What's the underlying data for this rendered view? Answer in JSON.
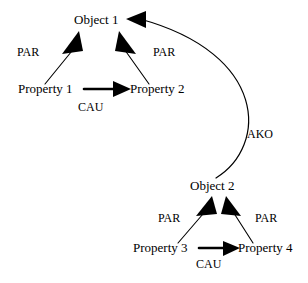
{
  "diagram": {
    "type": "node-link-diagram",
    "width": 308,
    "height": 283,
    "background_color": "#ffffff",
    "ink_color": "#000000",
    "nodes": [
      {
        "id": "object1",
        "label": "Object 1",
        "x": 74,
        "y": 24,
        "anchor": "start"
      },
      {
        "id": "property1",
        "label": "Property 1",
        "x": 18,
        "y": 93,
        "anchor": "start"
      },
      {
        "id": "property2",
        "label": "Property 2",
        "x": 130,
        "y": 93,
        "anchor": "start"
      },
      {
        "id": "object2",
        "label": "Object 2",
        "x": 190,
        "y": 190,
        "anchor": "start"
      },
      {
        "id": "property3",
        "label": "Property 3",
        "x": 133,
        "y": 252,
        "anchor": "start"
      },
      {
        "id": "property4",
        "label": "Property 4",
        "x": 238,
        "y": 252,
        "anchor": "start"
      }
    ],
    "edge_labels": [
      {
        "id": "par-top-left",
        "label": "PAR",
        "x": 17,
        "y": 56
      },
      {
        "id": "par-top-right",
        "label": "PAR",
        "x": 153,
        "y": 56
      },
      {
        "id": "cau-top",
        "label": "CAU",
        "x": 78,
        "y": 111
      },
      {
        "id": "ako",
        "label": "AKO",
        "x": 247,
        "y": 138
      },
      {
        "id": "par-bottom-left",
        "label": "PAR",
        "x": 158,
        "y": 222
      },
      {
        "id": "par-bottom-right",
        "label": "PAR",
        "x": 255,
        "y": 222
      },
      {
        "id": "cau-bottom",
        "label": "CAU",
        "x": 196,
        "y": 268
      }
    ],
    "edges": [
      {
        "id": "property1-par-object1",
        "relation": "PAR",
        "from": "property1",
        "to": "object1",
        "style": "thin",
        "path": "M 45 84 L 76 46"
      },
      {
        "id": "property2-par-object1",
        "relation": "PAR",
        "from": "property2",
        "to": "object1",
        "style": "thin",
        "path": "M 149 84 L 122 46"
      },
      {
        "id": "property1-cau-property2",
        "relation": "CAU",
        "from": "property1",
        "to": "property2",
        "style": "thick",
        "path": "M 84 89 L 114 89"
      },
      {
        "id": "object2-ako-object1",
        "relation": "AKO",
        "from": "object2",
        "to": "object1",
        "style": "curve",
        "path": "M 216 178 C 268 146 268 54 140 19"
      },
      {
        "id": "property3-par-object2",
        "relation": "PAR",
        "from": "property3",
        "to": "object2",
        "style": "thin",
        "path": "M 178 243 L 209 207"
      },
      {
        "id": "property4-par-object2",
        "relation": "PAR",
        "from": "property4",
        "to": "object2",
        "style": "thin",
        "path": "M 253 243 L 230 207"
      },
      {
        "id": "property3-cau-property4",
        "relation": "CAU",
        "from": "property3",
        "to": "property4",
        "style": "thick",
        "path": "M 199 248 L 225 248"
      }
    ],
    "arrow_heads": [
      {
        "id": "head-property1-object1",
        "points": "79,31 62,54 83,51",
        "edge": "property1-par-object1"
      },
      {
        "id": "head-property2-object1",
        "points": "119,31 136,54 115,51",
        "edge": "property2-par-object1"
      },
      {
        "id": "head-cau-top",
        "points": "131,89 113,81 113,97",
        "edge": "property1-cau-property2"
      },
      {
        "id": "head-ako-object1",
        "points": "126,19 146,11 146,28",
        "edge": "object2-ako-object1"
      },
      {
        "id": "head-property3-object2",
        "points": "212,196 196,216 217,214",
        "edge": "property3-par-object2"
      },
      {
        "id": "head-property4-object2",
        "points": "226,196 241,216 221,214",
        "edge": "property4-par-object2"
      },
      {
        "id": "head-cau-bottom",
        "points": "240,248 223,241 223,256",
        "edge": "property3-cau-property4"
      }
    ]
  }
}
